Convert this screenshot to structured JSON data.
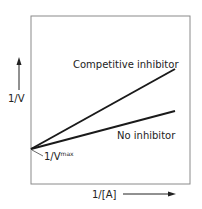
{
  "diagram": {
    "type": "Lineweaver-Burk plot",
    "y_axis_label": "1/V",
    "x_axis_label": "1/[A]",
    "intercept_label_main": "1/V",
    "intercept_label_sup": "max",
    "lines": [
      {
        "name": "Competitive inhibitor",
        "label": "Competitive inhibitor"
      },
      {
        "name": "No inhibitor",
        "label": "No inhibitor"
      }
    ],
    "colors": {
      "frame": "#8a8a8a",
      "line": "#1a1a1a",
      "text": "#222222"
    }
  }
}
